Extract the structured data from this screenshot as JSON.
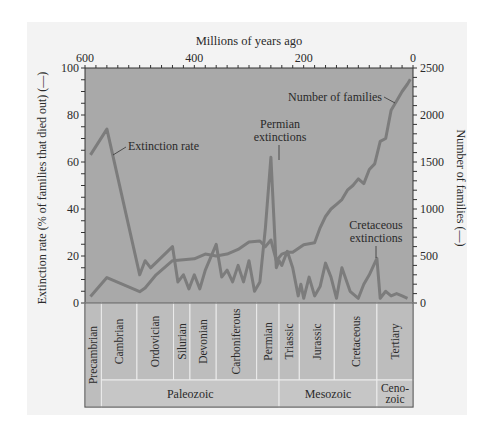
{
  "chart_data": {
    "type": "line",
    "title": "",
    "top_axis_label": "Millions of years ago",
    "xlabel": "Millions of years ago",
    "xlim": [
      600,
      0
    ],
    "x_ticks": [
      "600",
      "400",
      "200",
      "0"
    ],
    "ylabel_left": "Extinction rate (% of families that died out) (—)",
    "ylim_left": [
      0,
      100
    ],
    "y_ticks_left": [
      "0",
      "20",
      "40",
      "60",
      "80",
      "100"
    ],
    "ylabel_right": "Number of families (—)",
    "ylim_right": [
      0,
      2500
    ],
    "y_ticks_right": [
      "0",
      "500",
      "1000",
      "1500",
      "2000",
      "2500"
    ],
    "grid": false,
    "series": [
      {
        "name": "Extinction rate",
        "axis": "left",
        "x": [
          590,
          560,
          500,
          490,
          480,
          440,
          430,
          420,
          410,
          400,
          390,
          380,
          360,
          350,
          340,
          330,
          320,
          310,
          300,
          290,
          280,
          270,
          260,
          250,
          245,
          240,
          230,
          220,
          210,
          205,
          200,
          190,
          180,
          170,
          160,
          150,
          140,
          130,
          115,
          100,
          90,
          80,
          66,
          60,
          50,
          40,
          30,
          20,
          10
        ],
        "values": [
          63,
          74,
          12,
          18,
          15,
          24,
          9,
          12,
          6,
          12,
          6,
          14,
          25,
          11,
          14,
          9,
          16,
          9,
          18,
          5,
          9,
          32,
          62,
          15,
          18,
          16,
          22,
          15,
          3,
          8,
          2,
          11,
          3,
          7,
          17,
          11,
          2,
          15,
          5,
          2,
          8,
          12,
          19,
          2,
          5,
          3,
          4,
          3,
          2
        ]
      },
      {
        "name": "Number of families",
        "axis": "right",
        "x": [
          590,
          560,
          500,
          490,
          470,
          440,
          420,
          400,
          380,
          360,
          340,
          320,
          300,
          280,
          270,
          260,
          250,
          240,
          230,
          220,
          200,
          180,
          170,
          160,
          150,
          140,
          130,
          120,
          110,
          100,
          90,
          80,
          70,
          60,
          50,
          40,
          30,
          20,
          10,
          5
        ],
        "values": [
          70,
          270,
          120,
          160,
          300,
          450,
          460,
          470,
          520,
          500,
          520,
          570,
          650,
          660,
          600,
          670,
          450,
          520,
          540,
          540,
          620,
          640,
          800,
          920,
          1000,
          1050,
          1100,
          1200,
          1250,
          1320,
          1270,
          1420,
          1480,
          1720,
          1750,
          2050,
          2150,
          2250,
          2330,
          2380
        ]
      }
    ],
    "annotations": [
      {
        "text": "Extinction rate",
        "target_series": "Extinction rate"
      },
      {
        "text": "Number of families",
        "target_series": "Number of families"
      },
      {
        "text": "Permian extinctions",
        "x": 250,
        "y_left": 62
      },
      {
        "text": "Cretaceous extinctions",
        "x": 66,
        "y_left": 19
      }
    ],
    "periods": [
      {
        "name": "Precambrian",
        "from": 600,
        "to": 570
      },
      {
        "name": "Cambrian",
        "from": 570,
        "to": 505
      },
      {
        "name": "Ordovician",
        "from": 505,
        "to": 438
      },
      {
        "name": "Silurian",
        "from": 438,
        "to": 408
      },
      {
        "name": "Devonian",
        "from": 408,
        "to": 360
      },
      {
        "name": "Carboniferous",
        "from": 360,
        "to": 286
      },
      {
        "name": "Permian",
        "from": 286,
        "to": 245
      },
      {
        "name": "Triassic",
        "from": 245,
        "to": 208
      },
      {
        "name": "Jurassic",
        "from": 208,
        "to": 144
      },
      {
        "name": "Cretaceous",
        "from": 144,
        "to": 66
      },
      {
        "name": "Tertiary",
        "from": 66,
        "to": 2
      }
    ],
    "eras": [
      {
        "name": "Paleozoic",
        "from": 570,
        "to": 245
      },
      {
        "name": "Mesozoic",
        "from": 245,
        "to": 66
      },
      {
        "name": "Ceno-\nzoic",
        "line1": "Ceno-",
        "line2": "zoic",
        "from": 66,
        "to": 0
      }
    ]
  },
  "colors": {
    "plot_bg": "#a9a9a9",
    "line": "#7c7c7c",
    "period_bg": "#bdbdbd",
    "era_bg": "#c6c6c6",
    "text": "#2a2a2a"
  }
}
